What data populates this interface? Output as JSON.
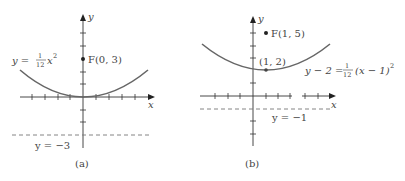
{
  "figure": {
    "panels": [
      {
        "id": "a",
        "caption": "(a)",
        "axis_x_label": "x",
        "axis_y_label": "y",
        "equation": {
          "lhs": "y = ",
          "frac_num": "1",
          "frac_den": "12",
          "rhs": "x",
          "exp": "2"
        },
        "focus_label": "F(0, 3)",
        "directrix_label": "y = −3",
        "focus": [
          0,
          3
        ],
        "vertex": [
          0,
          0
        ],
        "directrix": -3
      },
      {
        "id": "b",
        "caption": "(b)",
        "axis_x_label": "x",
        "axis_y_label": "y",
        "equation": {
          "lhs": "y − 2 = ",
          "frac_num": "1",
          "frac_den": "12",
          "rhs": "(x − 1)",
          "exp": "2"
        },
        "focus_label": "F(1, 5)",
        "vertex_label": "(1, 2)",
        "directrix_label": "y = −1",
        "focus": [
          1,
          5
        ],
        "vertex": [
          1,
          2
        ],
        "directrix": -1
      }
    ]
  },
  "colors": {
    "axis": "#333333",
    "curve": "#666666",
    "text": "#444444",
    "background": "#ffffff"
  }
}
